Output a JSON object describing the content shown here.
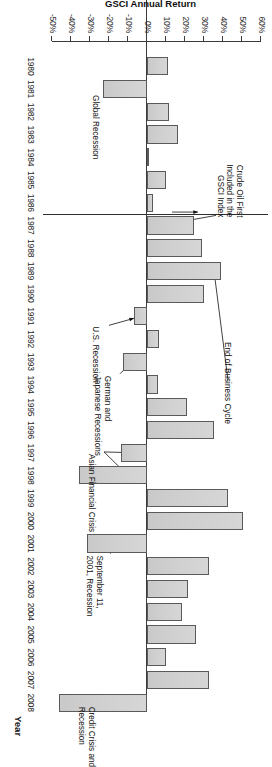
{
  "chart_data": {
    "type": "bar",
    "title": "",
    "orientation": "rotated-90",
    "xlabel": "Year",
    "ylabel": "GSCI Annual Return",
    "ylim": [
      -50,
      60
    ],
    "ytick_labels": [
      "60%",
      "50%",
      "40%",
      "30%",
      "20%",
      "10%",
      "0%",
      "-10%",
      "-20%",
      "-30%",
      "-40%",
      "-50%"
    ],
    "ytick_values": [
      60,
      50,
      40,
      30,
      20,
      10,
      0,
      -10,
      -20,
      -30,
      -40,
      -50
    ],
    "grid": false,
    "legend": "none",
    "categories": [
      "1980",
      "1981",
      "1982",
      "1983",
      "1984",
      "1985",
      "1986",
      "1987",
      "1988",
      "1989",
      "1990",
      "1991",
      "1992",
      "1993",
      "1994",
      "1995",
      "1996",
      "1997",
      "1998",
      "1999",
      "2000",
      "2001",
      "2002",
      "2003",
      "2004",
      "2005",
      "2006",
      "2007",
      "2008"
    ],
    "values": [
      11.1,
      -23.0,
      11.6,
      16.3,
      1.1,
      10.0,
      3.2,
      24.7,
      28.9,
      38.9,
      30.0,
      -6.8,
      6.3,
      -12.6,
      5.8,
      21.1,
      35.3,
      -13.7,
      -35.8,
      42.6,
      50.5,
      -31.6,
      32.6,
      21.6,
      18.4,
      25.6,
      9.8,
      32.7,
      -46.5
    ],
    "annotations": [
      {
        "id": "global-recession",
        "text": "Global Recession",
        "target_category": "1981"
      },
      {
        "id": "crude-oil-first-included",
        "text": "Crude Oil First\nIncluded in the\nGSCI Index",
        "target_category": "1987"
      },
      {
        "id": "us-recession",
        "text": "U.S. Recession",
        "target_category": "1991"
      },
      {
        "id": "german-japanese-recessions",
        "text": "German and\nJapanese Recessions",
        "target_category": "1993"
      },
      {
        "id": "end-of-business-cycle",
        "text": "End of Business Cycle",
        "target_category": "1989"
      },
      {
        "id": "asian-financial-crisis",
        "text": "Asian Financial Crisis",
        "target_category": "1997"
      },
      {
        "id": "september-11-2001-recession",
        "text": "September 11,\n2001, Recession",
        "target_category": "2001"
      },
      {
        "id": "credit-crisis-and-recession",
        "text": "Credit Crisis and\nRecession",
        "target_category": "2008"
      }
    ],
    "colors": {
      "bar_fill": "#d2d2d2",
      "bar_stroke": "#5a5a5a",
      "axis": "#3b3b3b",
      "text": "#111111"
    }
  },
  "axis": {
    "value_axis_title": "GSCI Annual Return",
    "category_axis_title": "Year"
  }
}
